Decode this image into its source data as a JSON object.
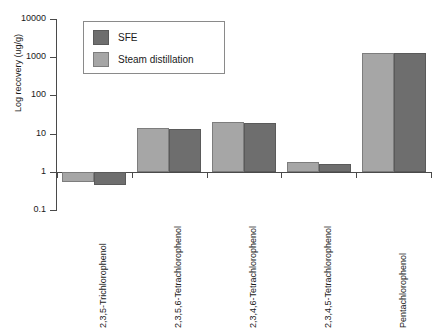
{
  "chart_data": {
    "type": "bar",
    "title": "",
    "xlabel": "",
    "ylabel": "Log recovery (ug/g)",
    "yscale": "log",
    "ylim": [
      0.1,
      10000
    ],
    "ytick_labels": [
      "10000",
      "1000",
      "100",
      "10",
      "1",
      "0.1"
    ],
    "ytick_values": [
      10000,
      1000,
      100,
      10,
      1,
      0.1
    ],
    "grid": false,
    "legend_position": "top-left-inside",
    "categories": [
      "2,3,5-Trichlorophenol",
      "2,3,5,6-Tetrachlorophenol",
      "2,3,4,6-Tetrachlorophenol",
      "2,3,4,5-Tetrachlorophenol",
      "Pentachlorophenol"
    ],
    "series": [
      {
        "name": "Steam distillation",
        "color": "#a6a6a6",
        "values": [
          0.55,
          14,
          20,
          1.8,
          1300
        ]
      },
      {
        "name": "SFE",
        "color": "#6e6e6e",
        "values": [
          0.45,
          13,
          19,
          1.6,
          1250
        ]
      }
    ]
  },
  "legend": {
    "items": [
      {
        "label": "SFE",
        "swatch": "sfe"
      },
      {
        "label": "Steam distillation",
        "swatch": "steam"
      }
    ]
  }
}
